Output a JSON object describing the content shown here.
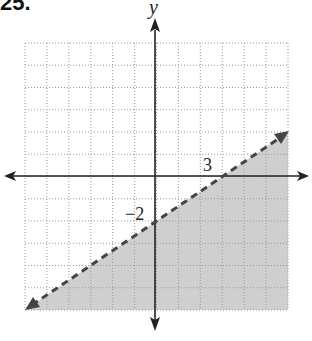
{
  "problem": {
    "number": "25."
  },
  "axes": {
    "x_label": "",
    "y_label": "y",
    "x_range": [
      -6,
      6
    ],
    "y_range": [
      -6,
      6
    ],
    "grid": true,
    "grid_style": "dotted"
  },
  "annotations": {
    "x_intercept_label": "3",
    "y_intercept_label": "−2"
  },
  "colors": {
    "shade": "#cfcfcf",
    "line": "#444444",
    "axis": "#222222",
    "grid": "#9a9a9a"
  },
  "chart_data": {
    "type": "line",
    "title": "",
    "boundary": {
      "slope": 0.6667,
      "intercept": -2,
      "style": "dashed",
      "points": [
        [
          -6,
          -6
        ],
        [
          0,
          -2
        ],
        [
          3,
          0
        ],
        [
          6,
          2
        ]
      ]
    },
    "shaded_region": "below",
    "inequality": "y < (2/3)x - 2",
    "xlim": [
      -6,
      6
    ],
    "ylim": [
      -6,
      6
    ],
    "labels": {
      "x_tick": "3",
      "y_tick": "-2",
      "y_axis": "y"
    }
  }
}
